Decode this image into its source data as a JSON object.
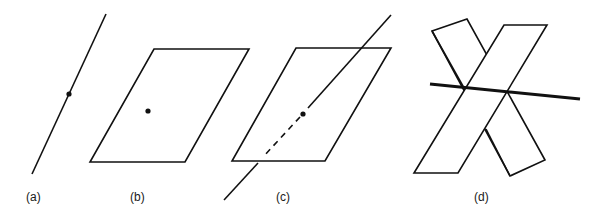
{
  "figure": {
    "panels": [
      {
        "id": "a",
        "label": "(a)",
        "content": "line with a point on it"
      },
      {
        "id": "b",
        "label": "(b)",
        "content": "plane (parallelogram) with a point on it"
      },
      {
        "id": "c",
        "label": "(c)",
        "content": "line piercing a plane at a point, hidden portion dashed"
      },
      {
        "id": "d",
        "label": "(d)",
        "content": "two intersecting planes with their line of intersection"
      }
    ]
  },
  "colors": {
    "stroke": "#111111",
    "background": "#ffffff"
  }
}
